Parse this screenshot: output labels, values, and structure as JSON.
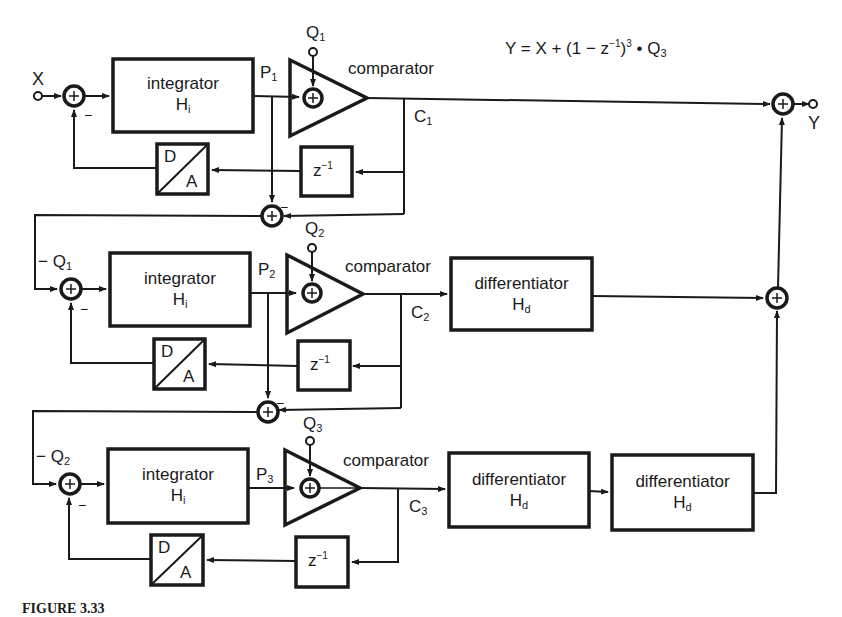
{
  "diagram": {
    "equation": {
      "lhs": "Y = X + (1 − z",
      "exp1": "−1",
      "mid": ")",
      "exp2": "3",
      "dot": " • Q",
      "sub": "3"
    },
    "io": {
      "input_label": "X",
      "output_label": "Y"
    },
    "blocks": {
      "integrator_label": "integrator",
      "integrator_sym": "H",
      "integrator_sub": "i",
      "differentiator_label": "differentiator",
      "differentiator_sym": "H",
      "differentiator_sub": "d",
      "comparator_label": "comparator",
      "dac_top": "D",
      "dac_bottom": "A",
      "delay_base": "z",
      "delay_exp": "−1"
    },
    "stages": [
      {
        "p": "P",
        "p_sub": "1",
        "q": "Q",
        "q_sub": "1",
        "c": "C",
        "c_sub": "1"
      },
      {
        "p": "P",
        "p_sub": "2",
        "q": "Q",
        "q_sub": "2",
        "c": "C",
        "c_sub": "2",
        "in_label": "− Q",
        "in_sub": "1"
      },
      {
        "p": "P",
        "p_sub": "3",
        "q": "Q",
        "q_sub": "3",
        "c": "C",
        "c_sub": "3",
        "in_label": "− Q",
        "in_sub": "2"
      }
    ],
    "minus_sign": "−",
    "caption": "FIGURE 3.33"
  },
  "colors": {
    "ink": "#1a1a1a",
    "background": "#ffffff"
  }
}
